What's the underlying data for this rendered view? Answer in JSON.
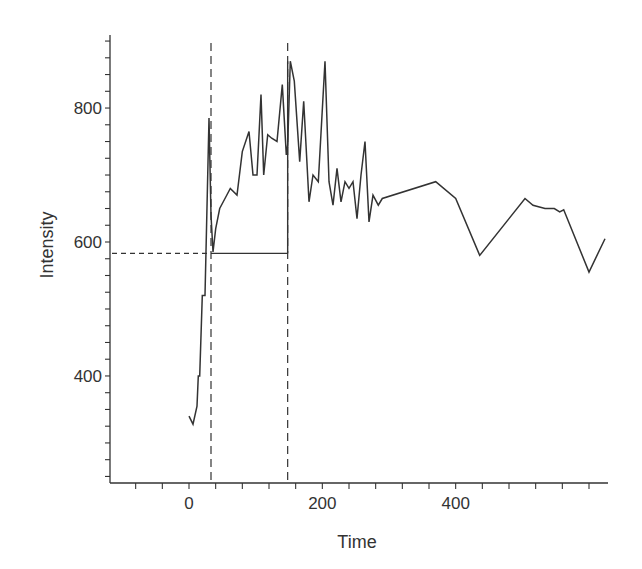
{
  "chart_data": {
    "type": "line",
    "title": "",
    "xlabel": "Time",
    "ylabel": "Intensity",
    "xlim": [
      -120,
      625
    ],
    "ylim": [
      240,
      910
    ],
    "x_ticks_labeled": [
      0,
      200,
      400
    ],
    "y_ticks_labeled": [
      400,
      600,
      800
    ],
    "x_minor_tick_step": 40,
    "y_minor_tick_step": 50,
    "grid": false,
    "legend": null,
    "series": [
      {
        "name": "Intensity",
        "x": [
          0,
          6,
          12,
          14,
          16,
          20,
          24,
          30,
          33,
          36,
          40,
          46,
          54,
          62,
          72,
          80,
          90,
          96,
          102,
          108,
          112,
          118,
          124,
          132,
          140,
          146,
          148,
          152,
          158,
          166,
          172,
          180,
          186,
          194,
          204,
          210,
          216,
          222,
          228,
          234,
          240,
          246,
          252,
          258,
          264,
          270,
          276,
          284,
          290,
          370,
          400,
          436,
          504,
          516,
          534,
          548,
          556,
          562,
          600,
          624
        ],
        "y": [
          340,
          328,
          355,
          400,
          400,
          520,
          520,
          785,
          640,
          585,
          620,
          650,
          665,
          680,
          670,
          735,
          765,
          700,
          700,
          820,
          700,
          760,
          755,
          750,
          835,
          730,
          745,
          870,
          840,
          720,
          810,
          660,
          700,
          690,
          870,
          690,
          655,
          710,
          660,
          690,
          680,
          690,
          635,
          700,
          750,
          630,
          670,
          655,
          665,
          690,
          665,
          580,
          665,
          655,
          650,
          650,
          645,
          648,
          555,
          605
        ]
      }
    ],
    "annotations": [
      {
        "type": "hline-dashed",
        "y": 583,
        "x_from": -120,
        "x_to": 30,
        "label": ""
      },
      {
        "type": "hline-solid",
        "y": 583,
        "x_from": 33,
        "x_to": 148,
        "label": ""
      },
      {
        "type": "vline-dashed",
        "x": 33,
        "label": ""
      },
      {
        "type": "vline-dashed",
        "x": 148,
        "label": ""
      },
      {
        "type": "vline-solid",
        "x": 148,
        "y_from": 583,
        "y_to": 870,
        "label": ""
      }
    ]
  }
}
